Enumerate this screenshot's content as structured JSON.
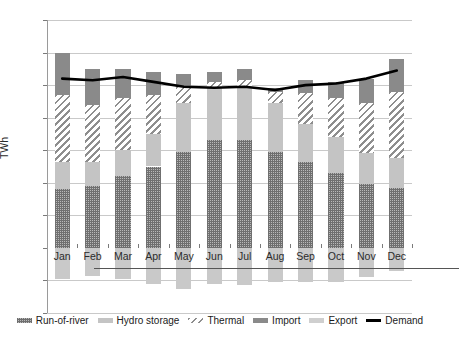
{
  "chart_data": {
    "type": "bar",
    "title": "",
    "subtitle": "",
    "xlabel": "",
    "ylabel": "TWh",
    "ylim": [
      -2,
      7
    ],
    "ytick_step": 1,
    "yticks": [
      7,
      6,
      5,
      4,
      3,
      2,
      1,
      0,
      -1,
      -2
    ],
    "ytick_labels": [
      "7",
      "6",
      "5",
      "4",
      "3",
      "2",
      "1",
      "0",
      "-1",
      "-2"
    ],
    "grid": true,
    "grid_axis": "y",
    "stacked": true,
    "legend_position": "bottom",
    "categories": [
      "Jan",
      "Feb",
      "Mar",
      "Apr",
      "May",
      "Jun",
      "Jul",
      "Aug",
      "Sep",
      "Oct",
      "Nov",
      "Dec"
    ],
    "series": [
      {
        "name": "Run-of-river",
        "kind": "bar-segment",
        "stack_order": 1,
        "pattern": "checker",
        "color": "#8f8f8f",
        "values": [
          1.8,
          1.9,
          2.2,
          2.5,
          2.95,
          3.3,
          3.3,
          2.95,
          2.65,
          2.3,
          1.95,
          1.85
        ]
      },
      {
        "name": "Hydro storage",
        "kind": "bar-segment",
        "stack_order": 2,
        "pattern": "solid-light",
        "color": "#c4c4c4",
        "values": [
          0.85,
          0.75,
          0.8,
          1.0,
          1.5,
          1.65,
          1.6,
          1.5,
          1.15,
          1.1,
          0.95,
          0.9
        ]
      },
      {
        "name": "Thermal",
        "kind": "bar-segment",
        "stack_order": 3,
        "pattern": "diagonal-hatch",
        "color": "#8e8e8e",
        "values": [
          2.05,
          1.75,
          1.6,
          1.2,
          0.5,
          0.15,
          0.25,
          0.35,
          0.95,
          1.2,
          1.55,
          2.05
        ]
      },
      {
        "name": "Import",
        "kind": "bar-segment",
        "stack_order": 4,
        "pattern": "solid-dark",
        "color": "#8a8a8a",
        "values": [
          1.3,
          1.1,
          0.9,
          0.7,
          0.4,
          0.3,
          0.35,
          0.1,
          0.4,
          0.5,
          0.75,
          1.0
        ]
      },
      {
        "name": "Export",
        "kind": "bar-segment-negative",
        "stack_order": 0,
        "pattern": "solid-light",
        "color": "#c9c9c9",
        "values": [
          -0.95,
          -0.87,
          -0.95,
          -1.1,
          -1.25,
          -1.1,
          -1.15,
          -1.05,
          -1.05,
          -1.05,
          -0.9,
          -0.7
        ]
      },
      {
        "name": "Demand",
        "kind": "line",
        "color": "#000000",
        "values": [
          5.2,
          5.15,
          5.25,
          5.1,
          4.95,
          4.92,
          4.95,
          4.85,
          5.0,
          5.05,
          5.2,
          5.45
        ]
      }
    ]
  },
  "legend": {
    "items": [
      {
        "label": "Run-of-river",
        "swatch": "checker-swatch"
      },
      {
        "label": "Hydro storage",
        "swatch": "light-solid-swatch"
      },
      {
        "label": "Thermal",
        "swatch": "hatch-swatch"
      },
      {
        "label": "Import",
        "swatch": "dark-solid-swatch"
      },
      {
        "label": "Export",
        "swatch": "pale-solid-swatch"
      },
      {
        "label": "Demand",
        "swatch": "line-swatch"
      }
    ]
  }
}
